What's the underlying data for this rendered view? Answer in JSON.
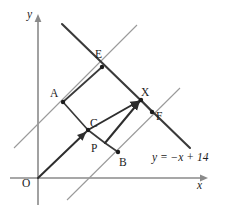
{
  "figure": {
    "kind": "geometry-diagram",
    "background_color": "#ffffff",
    "line_color_main": "#3a3a3a",
    "line_color_thin": "#9a9a9a",
    "axis_color": "#8a8a8a",
    "point_color": "#1c1c1c"
  },
  "axes": {
    "y_label": "y",
    "x_label": "x",
    "origin_label": "O",
    "y_axis": {
      "x": 38,
      "y_top": 18,
      "y_bottom": 205
    },
    "x_axis": {
      "y": 178,
      "x_left": 10,
      "x_right": 208
    }
  },
  "equation": {
    "text": "y = −x + 14",
    "x": 155,
    "y": 158
  },
  "points": [
    {
      "name": "O",
      "label": "O",
      "cx": 38,
      "cy": 178,
      "lx": 25,
      "ly": 186,
      "marker": false
    },
    {
      "name": "A",
      "label": "A",
      "cx": 63,
      "cy": 102,
      "lx": 52,
      "ly": 95,
      "marker": true
    },
    {
      "name": "E",
      "label": "E",
      "cx": 102,
      "cy": 67,
      "lx": 97,
      "ly": 57,
      "marker": true
    },
    {
      "name": "C",
      "label": "C",
      "cx": 88,
      "cy": 130,
      "lx": 92,
      "ly": 124,
      "marker": true
    },
    {
      "name": "P",
      "label": "P",
      "cx": 105,
      "cy": 143,
      "lx": 94,
      "ly": 150,
      "marker": false
    },
    {
      "name": "B",
      "label": "B",
      "cx": 118,
      "cy": 152,
      "lx": 121,
      "ly": 163,
      "marker": true
    },
    {
      "name": "X",
      "label": "X",
      "cx": 141,
      "cy": 100,
      "lx": 143,
      "ly": 95,
      "marker": true
    },
    {
      "name": "F",
      "label": "F",
      "cx": 152,
      "cy": 112,
      "lx": 157,
      "ly": 118,
      "marker": true
    }
  ],
  "lines": {
    "main_negative_slope": {
      "x1": 62,
      "y1": 24,
      "x2": 190,
      "y2": 148
    },
    "thin_through_A_E": {
      "x1": 14,
      "y1": 148,
      "x2": 137,
      "y2": 25
    },
    "thin_through_B_F": {
      "x1": 67,
      "y1": 200,
      "x2": 180,
      "y2": 88
    }
  },
  "segments": [
    {
      "name": "A-E",
      "x1": 63,
      "y1": 102,
      "x2": 102,
      "y2": 67
    },
    {
      "name": "E-X",
      "x1": 102,
      "y1": 67,
      "x2": 141,
      "y2": 100
    },
    {
      "name": "A-C",
      "x1": 63,
      "y1": 102,
      "x2": 88,
      "y2": 130
    },
    {
      "name": "C-P",
      "x1": 88,
      "y1": 130,
      "x2": 105,
      "y2": 143
    },
    {
      "name": "P-B",
      "x1": 105,
      "y1": 143,
      "x2": 118,
      "y2": 152
    },
    {
      "name": "P-X",
      "x1": 105,
      "y1": 143,
      "x2": 141,
      "y2": 100
    },
    {
      "name": "X-F",
      "x1": 141,
      "y1": 100,
      "x2": 152,
      "y2": 112
    }
  ],
  "vectors": [
    {
      "name": "O-to-C",
      "x1": 38,
      "y1": 178,
      "x2": 88,
      "y2": 130
    },
    {
      "name": "C-to-X",
      "x1": 88,
      "y1": 130,
      "x2": 141,
      "y2": 100
    },
    {
      "name": "P-to-X",
      "x1": 105,
      "y1": 143,
      "x2": 141,
      "y2": 100
    }
  ]
}
